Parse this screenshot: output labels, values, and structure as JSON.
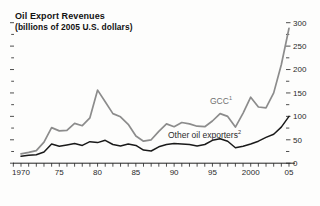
{
  "chart_data": {
    "type": "line",
    "title": "Oil Export Revenues",
    "subtitle": "(billions of 2005 U.S. dollars)",
    "x": [
      1970,
      1971,
      1972,
      1973,
      1974,
      1975,
      1976,
      1977,
      1978,
      1979,
      1980,
      1981,
      1982,
      1983,
      1984,
      1985,
      1986,
      1987,
      1988,
      1989,
      1990,
      1991,
      1992,
      1993,
      1994,
      1995,
      1996,
      1997,
      1998,
      1999,
      2000,
      2001,
      2002,
      2003,
      2004,
      2005
    ],
    "series": [
      {
        "name": "GCC",
        "footnote": "1",
        "color": "#8c8c8c",
        "values": [
          20,
          23,
          27,
          45,
          76,
          69,
          70,
          85,
          80,
          97,
          156,
          131,
          106,
          99,
          83,
          58,
          47,
          50,
          68,
          84,
          78,
          87,
          84,
          79,
          78,
          90,
          106,
          100,
          77,
          107,
          141,
          120,
          118,
          150,
          210,
          288
        ]
      },
      {
        "name": "Other oil exporters",
        "footnote": "2",
        "color": "#1a1a1a",
        "values": [
          15,
          17,
          18,
          24,
          41,
          36,
          39,
          42,
          38,
          46,
          44,
          49,
          40,
          37,
          41,
          38,
          28,
          26,
          35,
          40,
          42,
          41,
          40,
          37,
          40,
          49,
          52,
          47,
          33,
          36,
          41,
          47,
          55,
          62,
          77,
          100
        ]
      }
    ],
    "x_axis": {
      "tick_years": [
        1970,
        1975,
        1980,
        1985,
        1990,
        1995,
        2000,
        2005
      ],
      "tick_labels": [
        "1970",
        "75",
        "80",
        "85",
        "90",
        "95",
        "2000",
        "05"
      ],
      "minor_tick_every_years": 1
    },
    "y_axis": {
      "side": "right",
      "min": 0,
      "max": 300,
      "major_step": 50,
      "minor_step": 25,
      "tick_labels": [
        "0",
        "50",
        "100",
        "150",
        "200",
        "250",
        "300"
      ],
      "mirror_ticks_left": true
    },
    "grid": false,
    "legend": "inline-series-labels",
    "axis_color": "#222222",
    "label_color": "#2a2a2a"
  }
}
